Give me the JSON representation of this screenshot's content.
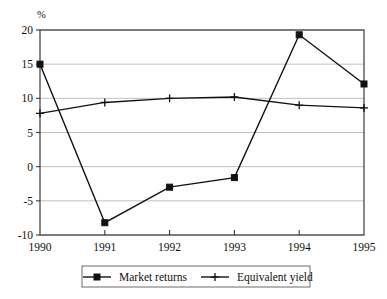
{
  "chart_data": {
    "type": "line",
    "title": "",
    "xlabel": "",
    "ylabel": "%",
    "categories": [
      "1990",
      "1991",
      "1992",
      "1993",
      "1994",
      "1995"
    ],
    "x": [
      1990,
      1991,
      1992,
      1993,
      1994,
      1995
    ],
    "series": [
      {
        "name": "Market returns",
        "marker": "square",
        "values": [
          15.0,
          -8.2,
          -3.0,
          -1.6,
          19.3,
          12.1
        ]
      },
      {
        "name": "Equivalent yield",
        "marker": "plus",
        "values": [
          7.8,
          9.4,
          10.0,
          10.2,
          9.0,
          8.6
        ]
      }
    ],
    "ylim": [
      -10,
      20
    ],
    "yticks": [
      20,
      15,
      10,
      5,
      0,
      -5,
      -10
    ],
    "ytick_labels": [
      "20",
      "15",
      "10",
      "5",
      "0",
      "-5",
      "-10"
    ],
    "xtick_labels": [
      "1990",
      "1991",
      "1992",
      "1993",
      "1994",
      "1995"
    ],
    "grid": true,
    "grid_axis": "y",
    "legend_position": "bottom-center",
    "colors": {
      "line": "#111111",
      "grid": "#b9b9b9",
      "frame": "#3a3a3a",
      "background": "#ffffff"
    }
  },
  "legend": {
    "items": [
      {
        "label": "Market returns",
        "marker": "square"
      },
      {
        "label": "Equivalent yield",
        "marker": "plus"
      }
    ]
  },
  "axis": {
    "unit_label": "%"
  }
}
